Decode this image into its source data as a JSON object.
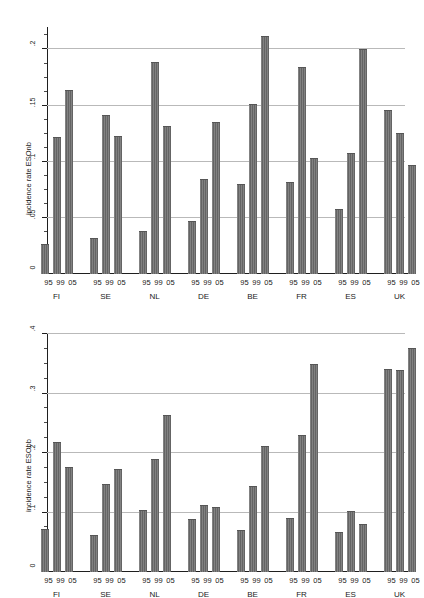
{
  "chart_data": [
    {
      "id": "top",
      "type": "bar",
      "title": "",
      "xlabel": "",
      "ylabel": "incidence rate ESOnb",
      "ylim": [
        0,
        0.22
      ],
      "yticks": [
        0,
        0.05,
        0.1,
        0.15,
        0.2
      ],
      "ytick_labels": [
        "0",
        ".05",
        ".1",
        ".15",
        ".2"
      ],
      "yminor_step": 0.0125,
      "grid": true,
      "legend": "none",
      "categories": [
        "FI",
        "SE",
        "NL",
        "DE",
        "BE",
        "FR",
        "ES",
        "UK"
      ],
      "subcategories": [
        "95",
        "99",
        "05"
      ],
      "series": [
        {
          "name": "95",
          "values": [
            0.027,
            0.032,
            0.038,
            0.047,
            0.08,
            0.082,
            0.058,
            0.146
          ]
        },
        {
          "name": "99",
          "values": [
            0.122,
            0.142,
            0.189,
            0.085,
            0.151,
            0.184,
            0.108,
            0.126
          ]
        },
        {
          "name": "05",
          "values": [
            0.164,
            0.123,
            0.132,
            0.135,
            0.212,
            0.103,
            0.2,
            0.097
          ]
        }
      ]
    },
    {
      "id": "bottom",
      "type": "bar",
      "title": "",
      "xlabel": "",
      "ylabel": "incidence rate ESObb",
      "ylim": [
        0,
        0.4
      ],
      "yticks": [
        0,
        0.1,
        0.2,
        0.3,
        0.4
      ],
      "ytick_labels": [
        "0",
        ".1",
        ".2",
        ".3",
        ".4"
      ],
      "yminor_step": 0.025,
      "grid": true,
      "legend": "none",
      "categories": [
        "FI",
        "SE",
        "NL",
        "DE",
        "BE",
        "FR",
        "ES",
        "UK"
      ],
      "subcategories": [
        "95",
        "99",
        "05"
      ],
      "series": [
        {
          "name": "95",
          "values": [
            0.072,
            0.063,
            0.104,
            0.089,
            0.071,
            0.091,
            0.068,
            0.341
          ]
        },
        {
          "name": "99",
          "values": [
            0.218,
            0.148,
            0.19,
            0.112,
            0.144,
            0.23,
            0.103,
            0.339
          ]
        },
        {
          "name": "05",
          "values": [
            0.177,
            0.173,
            0.264,
            0.11,
            0.212,
            0.349,
            0.08,
            0.376
          ]
        }
      ]
    }
  ],
  "style": {
    "bar_color": "#6f6f6f",
    "grid_color": "#b9b9b9",
    "axis_color": "#1f1f1f",
    "background": "#ffffff",
    "text_color": "#1a1a1a"
  }
}
